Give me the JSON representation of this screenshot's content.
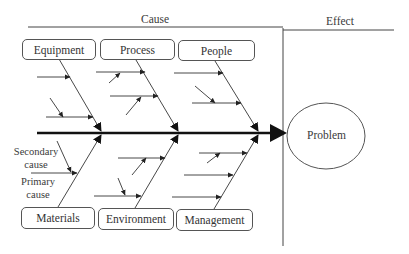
{
  "header": {
    "cause_label": "Cause",
    "effect_label": "Effect"
  },
  "categories_top": [
    {
      "label": "Equipment"
    },
    {
      "label": "Process"
    },
    {
      "label": "People"
    }
  ],
  "categories_bottom": [
    {
      "label": "Materials"
    },
    {
      "label": "Environment"
    },
    {
      "label": "Management"
    }
  ],
  "annotations": {
    "secondary_cause_line1": "Secondary",
    "secondary_cause_line2": "cause",
    "primary_cause_line1": "Primary",
    "primary_cause_line2": "cause"
  },
  "effect": {
    "label": "Problem"
  },
  "colors": {
    "line": "#333333",
    "spine": "#111111"
  }
}
